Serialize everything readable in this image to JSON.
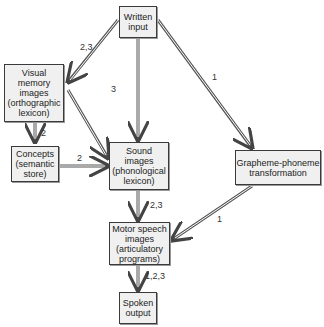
{
  "nodes": {
    "written_input": "Written\ninput",
    "visual_memory": "Visual\nmemory\nimages\n(orthographic\nlexicon)",
    "concepts": "Concepts\n(semantic\nstore)",
    "sound_images": "Sound\nimages\n(phonological\nlexicon)",
    "grapheme_phoneme": "Grapheme-phoneme\ntransformation",
    "motor_speech": "Motor speech\nimages\n(articulatory\nprograms)",
    "spoken_output": "Spoken\noutput"
  },
  "edges": [
    {
      "from": "written_input",
      "to": "visual_memory",
      "label": "2,3"
    },
    {
      "from": "written_input",
      "to": "sound_images",
      "label": "3"
    },
    {
      "from": "written_input",
      "to": "grapheme_phoneme",
      "label": "1"
    },
    {
      "from": "visual_memory",
      "to": "concepts",
      "label": "2"
    },
    {
      "from": "visual_memory",
      "to": "sound_images",
      "label": ""
    },
    {
      "from": "concepts",
      "to": "sound_images",
      "label": "2"
    },
    {
      "from": "sound_images",
      "to": "motor_speech",
      "label": "2,3"
    },
    {
      "from": "grapheme_phoneme",
      "to": "motor_speech",
      "label": "1"
    },
    {
      "from": "motor_speech",
      "to": "spoken_output",
      "label": "1,2,3"
    }
  ],
  "colors": {
    "box_fill": "#f0f0f0",
    "box_border": "#3a3a3a",
    "arrow": "#555555"
  }
}
